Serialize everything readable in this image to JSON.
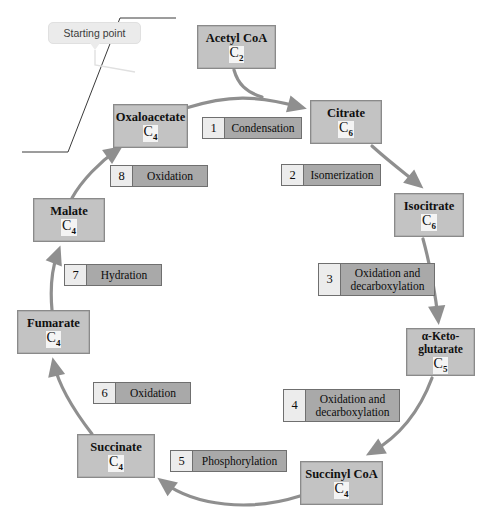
{
  "diagram": {
    "colors": {
      "molecule_fill": "#c3c3c3",
      "molecule_border": "#8a8a8a",
      "step_number_fill": "#ececec",
      "step_label_fill": "#a9a9a9",
      "step_border": "#6f6f6f",
      "arrow": "#8f8f8f",
      "callout_fill": "#ebebeb",
      "annotation_line": "#3a3a3a",
      "background": "#ffffff"
    },
    "callout": {
      "label": "Starting point",
      "points_to": "Oxaloacetate"
    },
    "molecules": [
      {
        "id": "acetyl-coa",
        "name": "Acetyl CoA",
        "carbon": "C",
        "carbon_sub": "2",
        "x": 197,
        "y": 25,
        "w": 79,
        "h": 44
      },
      {
        "id": "oxaloacetate",
        "name": "Oxaloacetate",
        "carbon": "C",
        "carbon_sub": "4",
        "x": 113,
        "y": 104,
        "w": 75,
        "h": 44
      },
      {
        "id": "citrate",
        "name": "Citrate",
        "carbon": "C",
        "carbon_sub": "6",
        "x": 310,
        "y": 100,
        "w": 72,
        "h": 44
      },
      {
        "id": "isocitrate",
        "name": "Isocitrate",
        "carbon": "C",
        "carbon_sub": "6",
        "x": 394,
        "y": 193,
        "w": 70,
        "h": 44
      },
      {
        "id": "alpha-ketoglutarate",
        "name": "α-Keto-\nglutarate",
        "carbon": "C",
        "carbon_sub": "5",
        "x": 406,
        "y": 328,
        "w": 69,
        "h": 48
      },
      {
        "id": "succinyl-coa",
        "name": "Succinyl CoA",
        "carbon": "C",
        "carbon_sub": "4",
        "x": 300,
        "y": 461,
        "w": 83,
        "h": 44
      },
      {
        "id": "succinate",
        "name": "Succinate",
        "carbon": "C",
        "carbon_sub": "4",
        "x": 77,
        "y": 434,
        "w": 78,
        "h": 44
      },
      {
        "id": "fumarate",
        "name": "Fumarate",
        "carbon": "C",
        "carbon_sub": "4",
        "x": 17,
        "y": 310,
        "w": 73,
        "h": 44
      },
      {
        "id": "malate",
        "name": "Malate",
        "carbon": "C",
        "carbon_sub": "4",
        "x": 33,
        "y": 198,
        "w": 72,
        "h": 44
      }
    ],
    "steps": [
      {
        "number": "1",
        "label": "Condensation",
        "x": 202,
        "y": 117,
        "w": 100,
        "h": 22
      },
      {
        "number": "2",
        "label": "Isomerization",
        "x": 281,
        "y": 164,
        "w": 100,
        "h": 22
      },
      {
        "number": "3",
        "label": "Oxidation and\ndecarboxylation",
        "x": 318,
        "y": 263,
        "w": 117,
        "h": 33
      },
      {
        "number": "4",
        "label": "Oxidation and\ndecarboxylation",
        "x": 283,
        "y": 389,
        "w": 117,
        "h": 33
      },
      {
        "number": "5",
        "label": "Phosphorylation",
        "x": 170,
        "y": 450,
        "w": 117,
        "h": 22
      },
      {
        "number": "6",
        "label": "Oxidation",
        "x": 93,
        "y": 382,
        "w": 98,
        "h": 22
      },
      {
        "number": "7",
        "label": "Hydration",
        "x": 64,
        "y": 264,
        "w": 98,
        "h": 22
      },
      {
        "number": "8",
        "label": "Oxidation",
        "x": 110,
        "y": 165,
        "w": 98,
        "h": 22
      }
    ],
    "reactions": [
      {
        "from": "Acetyl CoA",
        "to": "Citrate",
        "step": "1"
      },
      {
        "from": "Oxaloacetate",
        "to": "Citrate",
        "step": "1"
      },
      {
        "from": "Citrate",
        "to": "Isocitrate",
        "step": "2"
      },
      {
        "from": "Isocitrate",
        "to": "α-Ketoglutarate",
        "step": "3"
      },
      {
        "from": "α-Ketoglutarate",
        "to": "Succinyl CoA",
        "step": "4"
      },
      {
        "from": "Succinyl CoA",
        "to": "Succinate",
        "step": "5"
      },
      {
        "from": "Succinate",
        "to": "Fumarate",
        "step": "6"
      },
      {
        "from": "Fumarate",
        "to": "Malate",
        "step": "7"
      },
      {
        "from": "Malate",
        "to": "Oxaloacetate",
        "step": "8"
      }
    ]
  }
}
